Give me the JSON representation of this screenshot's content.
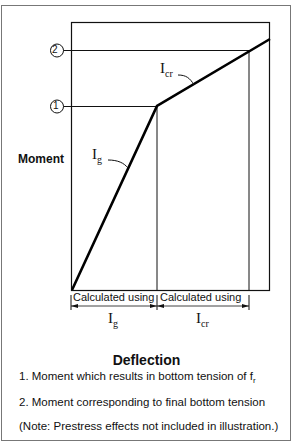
{
  "diagram": {
    "y_axis_label": "Moment",
    "x_axis_title": "Deflection",
    "markers": [
      {
        "id": "1",
        "label": "1"
      },
      {
        "id": "2",
        "label": "2"
      }
    ],
    "curve_labels": {
      "gross": {
        "main": "I",
        "sub": "g"
      },
      "cracked": {
        "main": "I",
        "sub": "cr"
      }
    },
    "regions": [
      {
        "text": "Calculated using",
        "symbol": "I",
        "sub": "g"
      },
      {
        "text": "Calculated using",
        "symbol": "I",
        "sub": "cr"
      }
    ],
    "notes": [
      {
        "text": "1.  Moment which results in bottom tension of f",
        "sub": "r"
      },
      {
        "text": "2.  Moment corresponding to final bottom tension"
      },
      {
        "text": "(Note: Prestress effects not included in illustration.)"
      }
    ]
  }
}
